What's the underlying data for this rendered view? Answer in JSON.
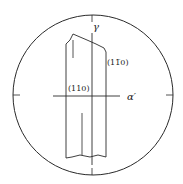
{
  "diagram": {
    "type": "stereographic-projection",
    "colors": {
      "line": "#2a2a2a",
      "background": "#ffffff"
    },
    "axes": {
      "vertical_label": "γ",
      "horizontal_label": "α′"
    },
    "planes": [
      {
        "label": "(110)"
      },
      {
        "label": "(1̄ 1 0)",
        "display": "(11̅0)"
      }
    ]
  }
}
